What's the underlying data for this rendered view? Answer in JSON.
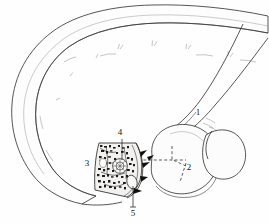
{
  "figure": {
    "background_color": "#fefefe",
    "ink_color": "#2b2b2b",
    "label_color": "#111111",
    "width": 269,
    "height": 223
  },
  "labels": [
    {
      "id": "1",
      "text": "1",
      "x": 198,
      "y": 115
    },
    {
      "id": "2",
      "text": "2",
      "x": 189,
      "y": 170
    },
    {
      "id": "3",
      "text": "3",
      "x": 87,
      "y": 166
    },
    {
      "id": "4",
      "text": "4",
      "x": 120,
      "y": 135
    },
    {
      "id": "5",
      "text": "5",
      "x": 133,
      "y": 213
    }
  ],
  "regions": {
    "curved_band": "large arcing double-outlined shaft sweeping from lower-left up over the top and down to the right edge",
    "cut_section": "sectioned window showing dense trabecular bone speckle texture",
    "lobes": "two overlapping rounded articular masses on the right",
    "reference_lines": "dashed axis lines converging at label 2"
  }
}
